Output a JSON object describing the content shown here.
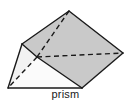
{
  "figure": {
    "caption": "prism",
    "shape_name": "prism",
    "shape_type": "triangular-prism",
    "background_color": "#ffffff",
    "stroke_color": "#1a1a1a",
    "stroke_width": 1.4,
    "hidden_edge_style": "dashed",
    "hidden_edge_dash": "5,3.5",
    "faces": [
      {
        "name": "top-left-face",
        "fill": "#c9c9c9",
        "points": "69,11 22,44 37,57 82,88"
      },
      {
        "name": "right-face",
        "fill": "#c9c9c9",
        "points": "69,11 123,53 82,88 37,57"
      },
      {
        "name": "front-left-triangle-face",
        "fill": "#f2f2f2",
        "points": "22,44 37,57 8,88"
      },
      {
        "name": "front-bottom-triangle-face",
        "fill": "#fbfbfb",
        "points": "8,88 37,57 82,88"
      }
    ],
    "visible_edges": [
      {
        "name": "edge-apex-to-backleft",
        "points": "69,11 22,44"
      },
      {
        "name": "edge-apex-to-right",
        "points": "69,11 123,53"
      },
      {
        "name": "edge-right-to-bottomright",
        "points": "123,53 82,88"
      },
      {
        "name": "edge-bottomright-to-bottomleft",
        "points": "82,88 8,88"
      },
      {
        "name": "edge-bottomleft-to-backleft",
        "points": "8,88 22,44"
      },
      {
        "name": "edge-backleft-to-frontmid",
        "points": "22,44 37,57"
      },
      {
        "name": "edge-frontmid-to-bottomright",
        "points": "37,57 82,88"
      }
    ],
    "hidden_edges": [
      {
        "name": "hidden-edge-apex-to-frontmid",
        "points": "69,11 37,57"
      },
      {
        "name": "hidden-edge-frontmid-to-right",
        "points": "37,57 123,53"
      },
      {
        "name": "hidden-edge-frontmid-to-bottomleft",
        "points": "37,57 8,88"
      }
    ],
    "vertices": {
      "apex": [
        69,
        11
      ],
      "back_left": [
        22,
        44
      ],
      "right": [
        123,
        53
      ],
      "bottom_left": [
        8,
        88
      ],
      "bottom_right": [
        82,
        88
      ],
      "front_mid": [
        37,
        57
      ]
    }
  }
}
